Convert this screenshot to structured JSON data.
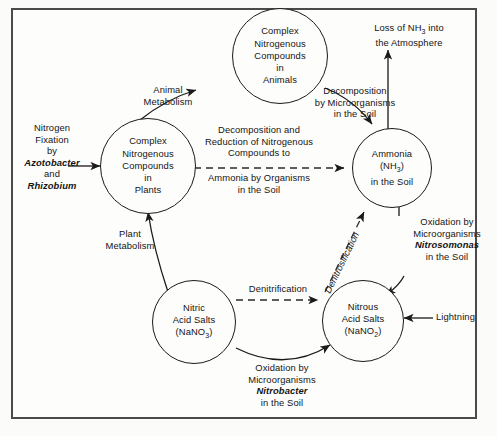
{
  "diagram": {
    "frame_color": "#4a4a4a",
    "ink_color": "#141414",
    "background": "#fdfdfc",
    "nodes": [
      {
        "id": "animals",
        "name": "node-complex-nitrogenous-compounds-in-animals",
        "lines": [
          "Complex",
          "Nitrogenous",
          "Compounds",
          "in",
          "Animals"
        ]
      },
      {
        "id": "plants",
        "name": "node-complex-nitrogenous-compounds-in-plants",
        "lines": [
          "Complex",
          "Nitrogenous",
          "Compounds",
          "in",
          "Plants"
        ]
      },
      {
        "id": "ammonia",
        "name": "node-ammonia-in-the-soil",
        "lines": [
          "Ammonia",
          "(NH3)",
          "in the Soil"
        ]
      },
      {
        "id": "nitrous",
        "name": "node-nitrous-acid-salts",
        "lines": [
          "Nitrous",
          "Acid Salts",
          "(NaNO2)"
        ]
      },
      {
        "id": "nitric",
        "name": "node-nitric-acid-salts",
        "lines": [
          "Nitric",
          "Acid Salts",
          "(NaNO3)"
        ]
      }
    ],
    "labels": {
      "loss_of_ammonia": [
        "Loss of NH3 into",
        "the Atmosphere"
      ],
      "decomposition_by_microorganisms": [
        "Decomposition",
        "by Microorganisms",
        "in the Soil"
      ],
      "animal_metabolism": [
        "Animal",
        "Metabolism"
      ],
      "nitrogen_fixation": [
        "Nitrogen",
        "Fixation",
        "by",
        "Azotobacter",
        "and",
        "Rhizobium"
      ],
      "nitrogen_fixation_italics": [
        "Azotobacter",
        "Rhizobium"
      ],
      "decomposition_reduction_top": [
        "Decomposition and",
        "Reduction of Nitrogenous",
        "Compounds to"
      ],
      "decomposition_reduction_bottom": [
        "Ammonia by Organisms",
        "in the Soil"
      ],
      "plant_metabolism": [
        "Plant",
        "Metabolism"
      ],
      "oxidation_nitrosomonas": [
        "Oxidation by",
        "Microorganisms",
        "Nitrosomonas",
        "in the Soil"
      ],
      "oxidation_nitrosomonas_italics": [
        "Nitrosomonas"
      ],
      "lightning": "Lightning",
      "denitrification": "Denitrification",
      "denitrosification": "Denitrosification",
      "oxidation_nitrobacter": [
        "Oxidation by",
        "Microorganisms",
        "Nitrobacter",
        "in the Soil"
      ],
      "oxidation_nitrobacter_italics": [
        "Nitrobacter"
      ]
    }
  }
}
